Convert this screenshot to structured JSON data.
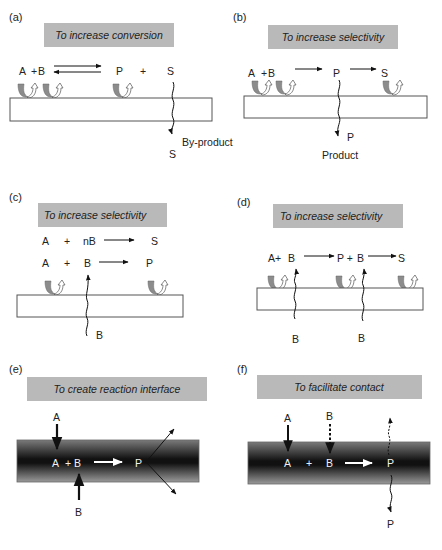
{
  "figure": {
    "panels": [
      {
        "id": "a",
        "label": "(a)",
        "title": "To increase conversion",
        "species": {
          "A": "A",
          "plus1": "+",
          "B": "B",
          "P": "P",
          "plus2": "+",
          "S": "S",
          "S_out": "S"
        },
        "annotation": "By-product",
        "reaction": "reversible"
      },
      {
        "id": "b",
        "label": "(b)",
        "title": "To increase selectivity",
        "species": {
          "A": "A",
          "plus1": "+",
          "B": "B",
          "P": "P",
          "S": "S",
          "P_out": "P"
        },
        "annotation": "Product",
        "reaction": "consecutive"
      },
      {
        "id": "c",
        "label": "(c)",
        "title": "To increase selectivity",
        "reactions": [
          {
            "r1": "A",
            "plus": "+",
            "r2": "nB",
            "product": "S"
          },
          {
            "r1": "A",
            "plus": "+",
            "r2": "B",
            "product": "P"
          }
        ],
        "feed": "B"
      },
      {
        "id": "d",
        "label": "(d)",
        "title": "To increase selectivity",
        "species": {
          "A": "A+",
          "B1": "B",
          "P": "P +",
          "B2": "B",
          "S": "S"
        },
        "feed1": "B",
        "feed2": "B"
      },
      {
        "id": "e",
        "label": "(e)",
        "title": "To create reaction interface",
        "top_feed": "A",
        "bottom_feed": "B",
        "inside": {
          "A": "A",
          "plus": "+",
          "B": "B",
          "P": "P"
        }
      },
      {
        "id": "f",
        "label": "(f)",
        "title": "To facilitate contact",
        "top_feed1": "A",
        "top_feed2": "B",
        "inside": {
          "A": "A",
          "plus": "+",
          "B": "B",
          "P": "P"
        },
        "bottom_out": "P"
      }
    ],
    "colors": {
      "title_box": "#b9b9b9",
      "membrane_stroke": "#555555",
      "membrane_dark": "#111111",
      "membrane_light": "#8a8a8a",
      "arrow_gray": "#8c8c8c"
    }
  }
}
